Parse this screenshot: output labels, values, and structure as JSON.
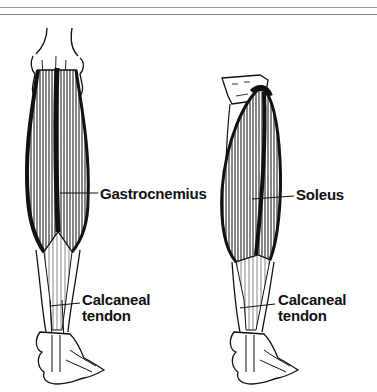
{
  "figure": {
    "type": "anatomical-illustration",
    "panels": [
      {
        "name": "gastrocnemius-view",
        "muscle_label": "Gastrocnemius",
        "tendon_label_line1": "Calcaneal",
        "tendon_label_line2": "tendon"
      },
      {
        "name": "soleus-view",
        "muscle_label": "Soleus",
        "tendon_label_line1": "Calcaneal",
        "tendon_label_line2": "tendon"
      }
    ]
  },
  "colors": {
    "ink": "#111111",
    "background": "#ffffff",
    "rule": "#9a9a9a"
  }
}
